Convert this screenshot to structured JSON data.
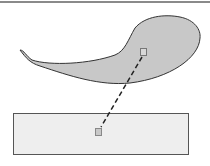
{
  "diagram": {
    "shapes": [
      {
        "id": "teardrop",
        "type": "freeform-teardrop",
        "fill": "#c8c8c8",
        "stroke": "#333333"
      },
      {
        "id": "rectangle",
        "type": "rectangle",
        "fill": "#eeeeee",
        "stroke": "#555555"
      }
    ],
    "handles": [
      {
        "id": "handle-teardrop",
        "fill": "#d8d8d8",
        "stroke": "#777777"
      },
      {
        "id": "handle-rectangle",
        "fill": "#c8c8c8",
        "stroke": "#888888"
      }
    ],
    "connector": {
      "style": "dashed",
      "color": "#222222",
      "from": "teardrop",
      "to": "rectangle"
    },
    "colors": {
      "top_border": "#8a8a8a"
    }
  }
}
